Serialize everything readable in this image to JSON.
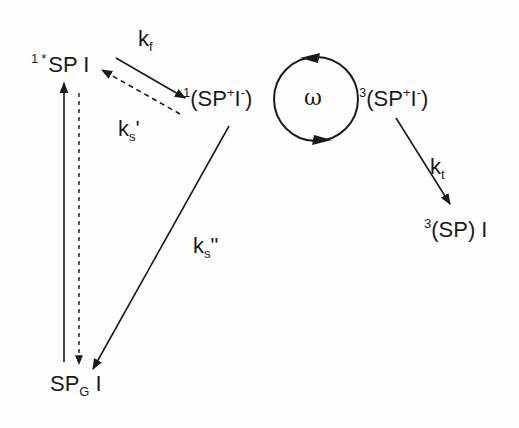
{
  "diagram": {
    "type": "reaction-scheme",
    "states": {
      "excited_singlet": {
        "pre_sup": "1",
        "star": "*",
        "main": "SP I"
      },
      "singlet_rp": {
        "pre_sup": "1",
        "open": "(SP",
        "sup_plus": "+",
        "mid": "I",
        "sup_minus": "-",
        "close": ")"
      },
      "triplet_rp": {
        "pre_sup": "3",
        "open": "(SP",
        "sup_plus": "+",
        "mid": "I",
        "sup_minus": "-",
        "close": ")"
      },
      "triplet_product": {
        "pre_sup": "3",
        "main": "(SP) I"
      },
      "ground": {
        "main": "SP",
        "sub": "G",
        "tail": " I"
      }
    },
    "rates": {
      "kf": {
        "k": "k",
        "sub": "f"
      },
      "ks_prime": {
        "k": "k",
        "sub": "s",
        "mark": "'"
      },
      "ks_dprime": {
        "k": "k",
        "sub": "s",
        "mark": "\""
      },
      "kt": {
        "k": "k",
        "sub": "t"
      },
      "omega": "ω"
    },
    "colors": {
      "ink": "#1a1a1a",
      "background": "#fefefe"
    }
  }
}
